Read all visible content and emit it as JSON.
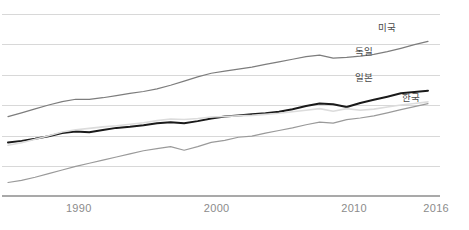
{
  "chart_data": {
    "type": "line",
    "title": "",
    "subtitle": "",
    "xlabel": "",
    "ylabel": "",
    "grid": true,
    "legend_position": "inline-right-end-labels",
    "xlim": [
      1985,
      2016
    ],
    "ylim": [
      0,
      7
    ],
    "x_tick_labels": [
      "1990",
      "2000",
      "2010",
      "2016"
    ],
    "x_ticks": [
      1990,
      2000,
      2010,
      2016
    ],
    "y_tick_labels": [],
    "x": [
      1985,
      1986,
      1987,
      1988,
      1989,
      1990,
      1991,
      1992,
      1993,
      1994,
      1995,
      1996,
      1997,
      1998,
      1999,
      2000,
      2001,
      2002,
      2003,
      2004,
      2005,
      2006,
      2007,
      2008,
      2009,
      2010,
      2011,
      2012,
      2013,
      2014,
      2015,
      2016
    ],
    "series": [
      {
        "name": "미국",
        "color": "#7d7d7d",
        "width": 1.2,
        "values": [
          3.05,
          3.2,
          3.35,
          3.5,
          3.63,
          3.72,
          3.72,
          3.78,
          3.86,
          3.95,
          4.02,
          4.12,
          4.26,
          4.42,
          4.58,
          4.72,
          4.8,
          4.88,
          4.96,
          5.06,
          5.16,
          5.26,
          5.36,
          5.42,
          5.3,
          5.33,
          5.38,
          5.45,
          5.55,
          5.68,
          5.82,
          5.95
        ]
      },
      {
        "name": "독일",
        "color": "#1a1a1a",
        "width": 2.0,
        "values": [
          2.06,
          2.12,
          2.2,
          2.3,
          2.42,
          2.48,
          2.45,
          2.54,
          2.62,
          2.66,
          2.72,
          2.8,
          2.84,
          2.8,
          2.88,
          2.98,
          3.06,
          3.1,
          3.14,
          3.18,
          3.24,
          3.34,
          3.46,
          3.56,
          3.53,
          3.42,
          3.58,
          3.7,
          3.82,
          3.95,
          4.0,
          4.05
        ]
      },
      {
        "name": "일본",
        "color": "#dcdcdc",
        "width": 1.6,
        "values": [
          1.95,
          2.05,
          2.18,
          2.32,
          2.46,
          2.55,
          2.6,
          2.66,
          2.7,
          2.76,
          2.82,
          2.9,
          2.96,
          2.94,
          2.98,
          3.04,
          3.06,
          3.08,
          3.1,
          3.14,
          3.18,
          3.24,
          3.3,
          3.36,
          3.26,
          3.36,
          3.3,
          3.34,
          3.42,
          3.5,
          3.56,
          3.62
        ]
      },
      {
        "name": "한국",
        "color": "#9a9a9a",
        "width": 1.2,
        "values": [
          0.52,
          0.6,
          0.72,
          0.86,
          1.0,
          1.14,
          1.26,
          1.38,
          1.5,
          1.62,
          1.74,
          1.82,
          1.9,
          1.76,
          1.9,
          2.06,
          2.14,
          2.26,
          2.3,
          2.42,
          2.52,
          2.62,
          2.74,
          2.84,
          2.8,
          2.94,
          3.0,
          3.08,
          3.2,
          3.32,
          3.44,
          3.55
        ]
      }
    ]
  },
  "axis": {
    "ticks": [
      {
        "label": "1990",
        "x_pct": 16.8
      },
      {
        "label": "2000",
        "x_pct": 46.2
      },
      {
        "label": "2010",
        "x_pct": 75.5
      },
      {
        "label": "2016",
        "x_pct": 93.0
      }
    ]
  },
  "series_labels": [
    {
      "name": "usa",
      "text": "미국",
      "left": 378,
      "top": 20
    },
    {
      "name": "germany",
      "text": "독일",
      "left": 355,
      "top": 44
    },
    {
      "name": "japan",
      "text": "일본",
      "left": 355,
      "top": 70
    },
    {
      "name": "korea",
      "text": "한국",
      "left": 402,
      "top": 90
    }
  ],
  "gridlines_y": [
    14,
    44.5,
    75,
    105.5,
    136,
    166.5
  ],
  "baseline_y": 196
}
